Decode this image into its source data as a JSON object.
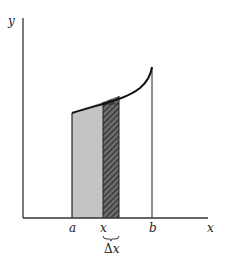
{
  "diagram": {
    "axis_labels": {
      "y": "y",
      "x": "x"
    },
    "tick_labels": {
      "a": "a",
      "x": "x",
      "b": "b"
    },
    "delta_label_prefix": "Δ",
    "delta_label_var": "x",
    "colors": {
      "axis": "#333333",
      "curve": "#111111",
      "light_fill": "#c4c4c4",
      "strip_fill": "#555555",
      "strip_hatch": "#222222"
    }
  }
}
